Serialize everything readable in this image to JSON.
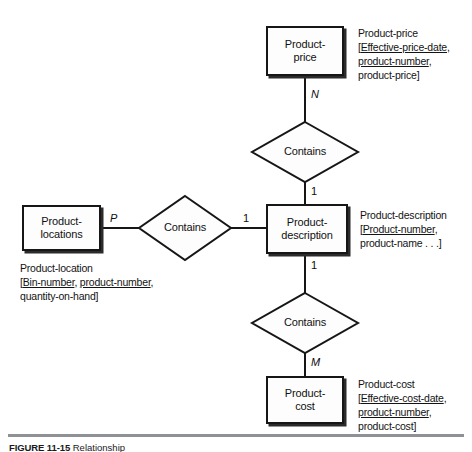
{
  "figure": {
    "caption_label": "FIGURE 11-15",
    "caption_text": "Relationship"
  },
  "entities": [
    {
      "id": "product-price",
      "line1": "Product-",
      "line2": "price"
    },
    {
      "id": "product-locations",
      "line1": "Product-",
      "line2": "locations"
    },
    {
      "id": "product-description",
      "line1": "Product-",
      "line2": "description"
    },
    {
      "id": "product-cost",
      "line1": "Product-",
      "line2": "cost"
    }
  ],
  "relationships": [
    {
      "id": "contains-top",
      "label": "Contains"
    },
    {
      "id": "contains-left",
      "label": "Contains"
    },
    {
      "id": "contains-bottom",
      "label": "Contains"
    }
  ],
  "cardinalities": [
    {
      "id": "price-to-contains",
      "value": "N",
      "italic": true
    },
    {
      "id": "contains-to-description",
      "value": "1",
      "italic": false
    },
    {
      "id": "locations-to-contains",
      "value": "P",
      "italic": true
    },
    {
      "id": "left-contains-to-desc",
      "value": "1",
      "italic": false
    },
    {
      "id": "description-to-contains",
      "value": "1",
      "italic": false
    },
    {
      "id": "contains-to-cost",
      "value": "M",
      "italic": true
    }
  ],
  "annotations": {
    "product_price": {
      "title": "Product-price",
      "lines": [
        {
          "prefix": "[",
          "underlined": "Effective-price-date",
          "suffix": ","
        },
        {
          "prefix": "",
          "underlined": "product-number",
          "suffix": ","
        },
        {
          "prefix": "",
          "underlined": "",
          "suffix": "product-price]"
        }
      ]
    },
    "product_description": {
      "title": "Product-description",
      "lines": [
        {
          "prefix": "[",
          "underlined": "Product-number",
          "suffix": ","
        },
        {
          "prefix": "",
          "underlined": "",
          "suffix": "product-name . . .]"
        }
      ]
    },
    "product_cost": {
      "title": "Product-cost",
      "lines": [
        {
          "prefix": "[",
          "underlined": "Effective-cost-date",
          "suffix": ","
        },
        {
          "prefix": "",
          "underlined": "product-number",
          "suffix": ","
        },
        {
          "prefix": "",
          "underlined": "",
          "suffix": "product-cost]"
        }
      ]
    },
    "product_location": {
      "title": "Product-location",
      "lines": [
        {
          "prefix": "[",
          "underlined": "Bin-number",
          "sep": ", ",
          "underlined2": "product-number",
          "suffix": ","
        },
        {
          "prefix": "",
          "underlined": "",
          "suffix": "quantity-on-hand]"
        }
      ]
    }
  },
  "colors": {
    "stroke": "#161616",
    "fill": "#fdfdfd",
    "text": "#111111",
    "rule": "#8e9296"
  }
}
